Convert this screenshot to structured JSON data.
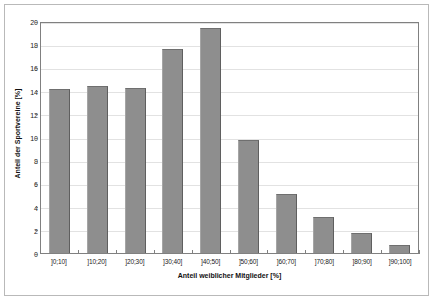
{
  "chart_data": {
    "type": "bar",
    "title": "",
    "subtitle": "",
    "xlabel": "Anteil weiblicher Mitglieder [%]",
    "ylabel": "Anteil der Sportvereine [%]",
    "categories": [
      "]0;10]",
      "]10;20]",
      "]20;30]",
      "]30;40]",
      "]40;50]",
      "]50;60]",
      "]60;70]",
      "]70;80]",
      "]80;90]",
      "]90;100]"
    ],
    "values": [
      14.1,
      14.4,
      14.2,
      17.6,
      19.4,
      9.7,
      5.1,
      3.1,
      1.7,
      0.7
    ],
    "ylim": [
      0,
      20
    ],
    "yticks": [
      0,
      2,
      4,
      6,
      8,
      10,
      12,
      14,
      16,
      18,
      20
    ],
    "ytick_labels": [
      "0",
      "2",
      "4",
      "6",
      "8",
      "10",
      "12",
      "14",
      "16",
      "18",
      "20"
    ],
    "grid": true,
    "legend": null,
    "legend_position": "none",
    "bar_color": "#8e8e8e",
    "bar_edge_color": "#5f5f5f",
    "axis_color": "#808080",
    "grid_color": "#e2e2e2",
    "background_color": "#ffffff",
    "frame_color": "#b9b9b9"
  }
}
